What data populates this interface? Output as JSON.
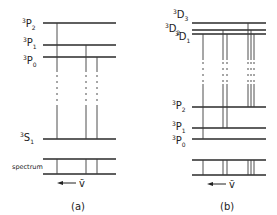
{
  "panels": [
    {
      "caption": "(a)",
      "levels": [
        {
          "term": "P",
          "multiplicity": "3",
          "j": "2",
          "y": 23
        },
        {
          "term": "P",
          "multiplicity": "3",
          "j": "1",
          "y": 45
        },
        {
          "term": "P",
          "multiplicity": "3",
          "j": "0",
          "y": 57
        },
        {
          "term": "S",
          "multiplicity": "3",
          "j": "1",
          "y": 139
        }
      ],
      "spectrum_label": "spectrum",
      "wavenumber_symbol": "ṽ",
      "transitions": 3
    },
    {
      "caption": "(b)",
      "levels": [
        {
          "term": "D",
          "multiplicity": "3",
          "j": "3",
          "y": 23
        },
        {
          "term": "D",
          "multiplicity": "3",
          "j": "2",
          "y": 30
        },
        {
          "term": "D",
          "multiplicity": "3",
          "j": "1",
          "y": 34
        },
        {
          "term": "P",
          "multiplicity": "3",
          "j": "2",
          "y": 107
        },
        {
          "term": "P",
          "multiplicity": "3",
          "j": "1",
          "y": 128
        },
        {
          "term": "P",
          "multiplicity": "3",
          "j": "0",
          "y": 139
        }
      ],
      "wavenumber_symbol": "ṽ",
      "transitions": 6
    }
  ],
  "labels": {
    "a_P2": {
      "sup": "3",
      "base": "P",
      "sub": "2"
    },
    "a_P1": {
      "sup": "3",
      "base": "P",
      "sub": "1"
    },
    "a_P0": {
      "sup": "3",
      "base": "P",
      "sub": "0"
    },
    "a_S1": {
      "sup": "3",
      "base": "S",
      "sub": "1"
    },
    "b_D3": {
      "sup": "3",
      "base": "D",
      "sub": "3"
    },
    "b_D2": {
      "sup": "3",
      "base": "D",
      "sub": "2"
    },
    "b_D1": {
      "sup": "3",
      "base": "D",
      "sub": "1"
    },
    "b_P2": {
      "sup": "3",
      "base": "P",
      "sub": "2"
    },
    "b_P1": {
      "sup": "3",
      "base": "P",
      "sub": "1"
    },
    "b_P0": {
      "sup": "3",
      "base": "P",
      "sub": "0"
    },
    "spectrum": "spectrum",
    "nu_tilde": "ṽ",
    "caption_a": "(a)",
    "caption_b": "(b)"
  }
}
